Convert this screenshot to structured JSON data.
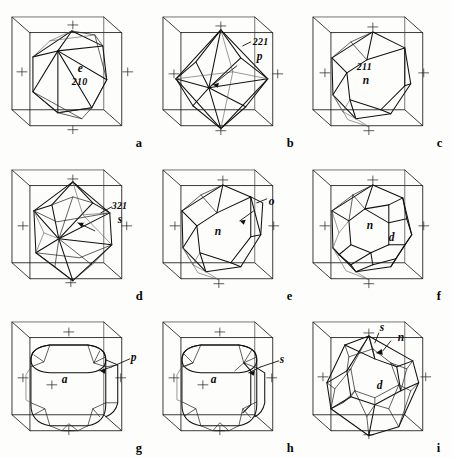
{
  "figure": {
    "grid": {
      "rows": 3,
      "cols": 3
    },
    "background_color": "#fdfdfc",
    "line_color": "#111111"
  },
  "panels": [
    {
      "key": "a",
      "panel_label": "a",
      "form_name": "trapezohedron-e",
      "labels": [
        {
          "name": "face-symbol",
          "text": "e"
        },
        {
          "name": "miller-index",
          "text": "210"
        }
      ]
    },
    {
      "key": "b",
      "panel_label": "b",
      "form_name": "trisoctahedron-p",
      "labels": [
        {
          "name": "miller-index",
          "text": "221"
        },
        {
          "name": "face-symbol",
          "text": "p"
        }
      ]
    },
    {
      "key": "c",
      "panel_label": "c",
      "form_name": "trapezohedron-n",
      "labels": [
        {
          "name": "miller-index",
          "text": "211"
        },
        {
          "name": "face-symbol",
          "text": "n"
        }
      ]
    },
    {
      "key": "d",
      "panel_label": "d",
      "form_name": "hexoctahedron-s",
      "labels": [
        {
          "name": "miller-index",
          "text": "321"
        },
        {
          "name": "face-symbol",
          "text": "s"
        }
      ]
    },
    {
      "key": "e",
      "panel_label": "e",
      "form_name": "trapezohedron-n-with-octahedron-o",
      "labels": [
        {
          "name": "face-symbol",
          "text": "n"
        },
        {
          "name": "face-symbol",
          "text": "o"
        }
      ]
    },
    {
      "key": "f",
      "panel_label": "f",
      "form_name": "trapezohedron-n-with-dodecahedron-d",
      "labels": [
        {
          "name": "face-symbol",
          "text": "n"
        },
        {
          "name": "face-symbol",
          "text": "d"
        }
      ]
    },
    {
      "key": "g",
      "panel_label": "g",
      "form_name": "cube-a-with-trisoctahedron-p",
      "labels": [
        {
          "name": "face-symbol",
          "text": "a"
        },
        {
          "name": "face-symbol",
          "text": "p"
        }
      ]
    },
    {
      "key": "h",
      "panel_label": "h",
      "form_name": "cube-a-with-hexoctahedron-s",
      "labels": [
        {
          "name": "face-symbol",
          "text": "a"
        },
        {
          "name": "face-symbol",
          "text": "s"
        }
      ]
    },
    {
      "key": "i",
      "panel_label": "i",
      "form_name": "dodecahedron-d-with-s-and-n",
      "labels": [
        {
          "name": "face-symbol",
          "text": "s"
        },
        {
          "name": "face-symbol",
          "text": "n"
        },
        {
          "name": "face-symbol",
          "text": "d"
        }
      ]
    }
  ]
}
